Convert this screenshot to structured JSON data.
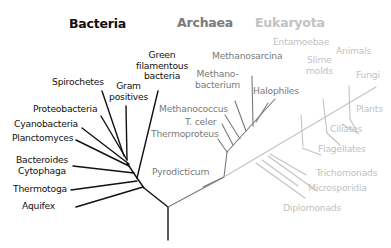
{
  "diagram": {
    "type": "phylogenetic-tree",
    "colors": {
      "bacteria": "#111111",
      "archaea": "#7a7a7a",
      "eukaryota": "#c2c2c2"
    },
    "domains": {
      "bacteria": "Bacteria",
      "archaea": "Archaea",
      "eukaryota": "Eukaryota"
    },
    "bacteria": {
      "green_filamentous": "Green\nfilamentous\nbacteria",
      "spirochetes": "Spirochetes",
      "gram_positives": "Gram\npositives",
      "proteobacteria": "Proteobacteria",
      "cyanobacteria": "Cyanobacteria",
      "planctomyces": "Planctomyces",
      "bacteroides": "Bacteroides\nCytophaga",
      "thermotoga": "Thermotoga",
      "aquifex": "Aquifex"
    },
    "archaea": {
      "methanosarcina": "Methanosarcina",
      "methanobacterium": "Methano-\nbacterium",
      "halophiles": "Halophiles",
      "methanococcus": "Methanococcus",
      "t_celer": "T. celer",
      "thermoproteus": "Thermoproteus",
      "pyrodicticum": "Pyrodicticum"
    },
    "eukaryota": {
      "entamoebae": "Entamoebae",
      "slime_molds": "Slime\nmolds",
      "animals": "Animals",
      "fungi": "Fungi",
      "plants": "Plants",
      "ciliates": "Ciliates",
      "flagellates": "Flagellates",
      "trichomonads": "Trichomonads",
      "microsporidia": "Microsporidia",
      "diplomonads": "Diplomonads"
    }
  }
}
